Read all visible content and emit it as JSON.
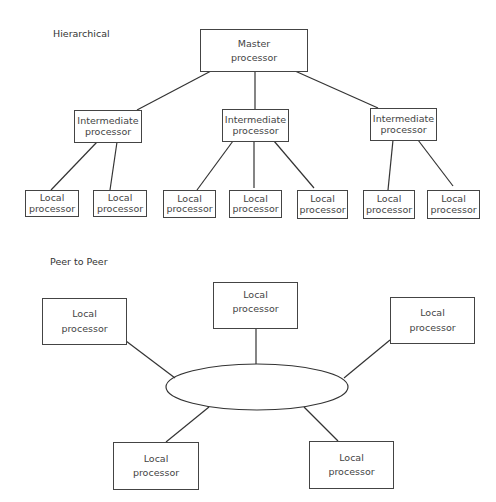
{
  "hierarchical": {
    "title": "Hierarchical",
    "master": {
      "line1": "Master",
      "line2": "processor"
    },
    "intermediates": [
      {
        "line1": "Intermediate",
        "line2": "processor"
      },
      {
        "line1": "Intermediate",
        "line2": "processor"
      },
      {
        "line1": "Intermediate",
        "line2": "processor"
      }
    ],
    "locals": [
      {
        "line1": "Local",
        "line2": "processor"
      },
      {
        "line1": "Local",
        "line2": "processor"
      },
      {
        "line1": "Local",
        "line2": "processor"
      },
      {
        "line1": "Local",
        "line2": "processor"
      },
      {
        "line1": "Local",
        "line2": "processor"
      },
      {
        "line1": "Local",
        "line2": "processor"
      },
      {
        "line1": "Local",
        "line2": "processor"
      }
    ]
  },
  "peer_to_peer": {
    "title": "Peer to Peer",
    "nodes": [
      {
        "line1": "Local",
        "line2": "processor"
      },
      {
        "line1": "Local",
        "line2": "processor"
      },
      {
        "line1": "Local",
        "line2": "processor"
      },
      {
        "line1": "Local",
        "line2": "processor"
      },
      {
        "line1": "Local",
        "line2": "processor"
      }
    ]
  }
}
